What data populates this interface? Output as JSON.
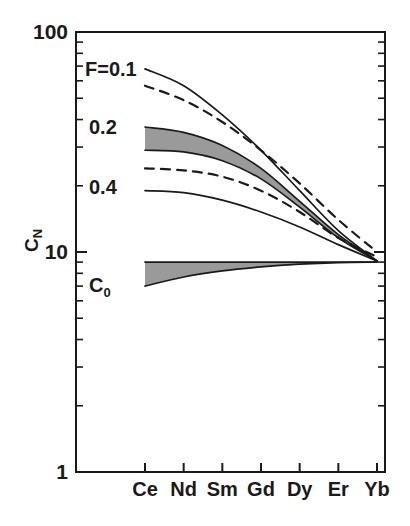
{
  "chart_data": {
    "type": "line",
    "title": "",
    "subtitle": "",
    "xlabel": "",
    "ylabel": "C_N",
    "ylabel_base": "C",
    "ylabel_sub": "N",
    "yscale": "log",
    "ylim": [
      1,
      100
    ],
    "y_major_ticks": [
      1,
      10,
      100
    ],
    "y_major_tick_labels": [
      "1",
      "10",
      "100"
    ],
    "y_minor_ticks": [
      2,
      3,
      4,
      5,
      6,
      7,
      8,
      9,
      20,
      30,
      40,
      50,
      60,
      70,
      80,
      90
    ],
    "grid": false,
    "legend_position": "inline-annotations",
    "categories": [
      "Ce",
      "Nd",
      "Sm",
      "Gd",
      "Dy",
      "Er",
      "Yb"
    ],
    "x_tick_labels": [
      "Ce",
      "Nd",
      "Sm",
      "Gd",
      "Dy",
      "Er",
      "Yb"
    ],
    "annotations": [
      {
        "id": "F01",
        "text": "F=0.1",
        "base": "F=0.1",
        "sub": "",
        "x_px": 85,
        "y_px": 76
      },
      {
        "id": "F02",
        "text": "0.2",
        "base": "0.2",
        "sub": "",
        "x_px": 89,
        "y_px": 134
      },
      {
        "id": "F04",
        "text": "0.4",
        "base": "0.4",
        "sub": "",
        "x_px": 89,
        "y_px": 194
      },
      {
        "id": "C0",
        "text": "C0",
        "base": "C",
        "sub": "0",
        "x_px": 89,
        "y_px": 292
      }
    ],
    "series": [
      {
        "name": "F=0.1 solid",
        "style": "solid",
        "values": [
          68,
          57,
          42,
          29,
          19,
          12.5,
          9.1
        ]
      },
      {
        "name": "F=0.1 dashed",
        "style": "dashed",
        "values": [
          57,
          49,
          39,
          29,
          20.5,
          14.0,
          10.0
        ]
      },
      {
        "name": "F=0.2 band upper",
        "style": "solid",
        "values": [
          37,
          35,
          30.5,
          24,
          17.0,
          12.0,
          9.1
        ]
      },
      {
        "name": "F=0.2 band lower",
        "style": "solid",
        "values": [
          29,
          28.5,
          26.0,
          21.5,
          16.0,
          11.6,
          9.1
        ]
      },
      {
        "name": "F=0.4 dashed",
        "style": "dashed",
        "values": [
          24,
          23.5,
          22.0,
          19.0,
          15.2,
          11.6,
          9.5
        ]
      },
      {
        "name": "F=0.4 solid",
        "style": "solid",
        "values": [
          19,
          18.6,
          17.2,
          15.2,
          13.0,
          10.8,
          9.1
        ]
      },
      {
        "name": "C0 band upper",
        "style": "solid",
        "values": [
          9.0,
          9.0,
          9.0,
          9.0,
          9.0,
          9.0,
          9.0
        ]
      },
      {
        "name": "C0 band lower",
        "style": "solid",
        "values": [
          7.0,
          7.7,
          8.2,
          8.55,
          8.8,
          8.95,
          9.0
        ]
      }
    ],
    "bands": [
      {
        "name": "F=0.2 band",
        "upper": "F=0.2 band upper",
        "lower": "F=0.2 band lower",
        "fill": "#9a9a9a"
      },
      {
        "name": "C0 band",
        "upper": "C0 band upper",
        "lower": "C0 band lower",
        "fill": "#9a9a9a"
      }
    ],
    "colors": {
      "line": "#1a1a1a",
      "band_fill": "#9a9a9a",
      "axis": "#1a1a1a",
      "background": "#ffffff"
    }
  }
}
